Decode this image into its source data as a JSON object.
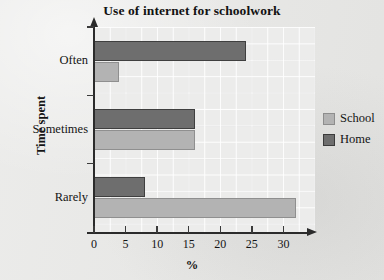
{
  "chart_data": {
    "type": "bar",
    "orientation": "horizontal",
    "title": "Use of internet for schoolwork",
    "xlabel": "%",
    "ylabel": "Time spent",
    "categories": [
      "Often",
      "Sometimes",
      "Rarely"
    ],
    "series": [
      {
        "name": "School",
        "color": "#b3b3b3",
        "values": [
          4,
          16,
          32
        ]
      },
      {
        "name": "Home",
        "color": "#6e6e6e",
        "values": [
          24,
          16,
          8
        ]
      }
    ],
    "xlim": [
      0,
      35
    ],
    "xticks": [
      0,
      5,
      10,
      15,
      20,
      25,
      30
    ],
    "xtick_labels": [
      "0",
      "5",
      "10",
      "15",
      "20",
      "25",
      "30"
    ],
    "grid": true,
    "legend_position": "right",
    "legend_entries": [
      "School",
      "Home"
    ]
  },
  "style": {
    "background": "#e6e6e4",
    "plot_background": "#ececeb",
    "axis_color": "#2b2b2b",
    "text_color": "#141414"
  }
}
